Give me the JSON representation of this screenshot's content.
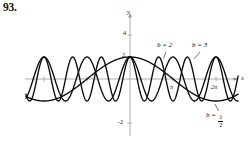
{
  "problem": {
    "number": "93."
  },
  "axes": {
    "y_axis_label": "y",
    "x_axis_label": "x",
    "y_ticks": [
      {
        "label": "4",
        "value": 4
      },
      {
        "label": "2",
        "value": 2
      },
      {
        "label": "-2",
        "value": -2
      }
    ],
    "x_ticks": [
      {
        "label": "π",
        "value": 3.14159
      },
      {
        "label": "2π",
        "value": 6.28319
      }
    ],
    "axis_color": "#8d8d8d",
    "curve_color": "#0a0a0a"
  },
  "labels": {
    "b2": {
      "prefix": "b = ",
      "value": "2"
    },
    "b3": {
      "prefix": "b = ",
      "value": "3"
    },
    "bhalf": {
      "prefix": "b = ",
      "numerator": "1",
      "denominator": "2"
    }
  },
  "chart_data": {
    "type": "line",
    "title": "",
    "subtitle": "",
    "xlabel": "x",
    "ylabel": "y",
    "xlim": [
      -7.9,
      8.1
    ],
    "ylim": [
      -2.6,
      4.4
    ],
    "grid": false,
    "legend": "inline-annotations",
    "x_tick_values": [
      3.14159,
      6.28319
    ],
    "x_tick_labels": [
      "π",
      "2π"
    ],
    "y_tick_values": [
      4,
      2,
      -2
    ],
    "y_tick_labels": [
      "4",
      "2",
      "-2"
    ],
    "function_form": "y = cos(b x)",
    "series": [
      {
        "name": "b = 1/2",
        "b": 0.5,
        "annotation": "b = 1/2",
        "annotation_xy": [
          6.0,
          -1.35
        ],
        "x_domain": [
          -7.6,
          7.9
        ],
        "amplitude": 1,
        "period": 12.566
      },
      {
        "name": "b = 2",
        "b": 2,
        "annotation": "b = 2",
        "annotation_xy": [
          1.6,
          1.55
        ],
        "x_domain": [
          -7.6,
          7.9
        ],
        "amplitude": 1,
        "period": 3.1416
      },
      {
        "name": "b = 3",
        "b": 3,
        "annotation": "b = 3",
        "annotation_xy": [
          3.9,
          1.55
        ],
        "x_domain": [
          -7.6,
          7.9
        ],
        "amplitude": 1,
        "period": 2.0944
      }
    ]
  }
}
